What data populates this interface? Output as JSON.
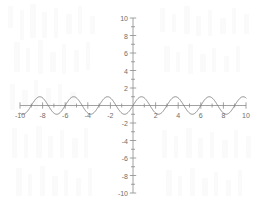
{
  "chart_data": {
    "type": "line",
    "title": "",
    "subtitle": "",
    "xlabel": "",
    "ylabel": "",
    "xlim": [
      -10,
      10
    ],
    "ylim": [
      -10,
      10
    ],
    "grid": false,
    "legend": null,
    "axis_style": "cartesian-crosshair",
    "x_tick_labels": [
      "-10",
      "-8",
      "-6",
      "-4",
      "-2",
      "2",
      "4",
      "6",
      "8",
      "10"
    ],
    "x_tick_values": [
      -10,
      -8,
      -6,
      -4,
      -2,
      2,
      4,
      6,
      8,
      10
    ],
    "x_minor_tick_step": 1,
    "y_tick_labels": [
      "10",
      "8",
      "6",
      "4",
      "2",
      "-2",
      "-4",
      "-6",
      "-8",
      "-10"
    ],
    "y_tick_values": [
      10,
      8,
      6,
      4,
      2,
      -2,
      -4,
      -6,
      -8,
      -10
    ],
    "y_minor_tick_step": 1,
    "series": [
      {
        "name": "cosine wave",
        "color": "#7a7a7a",
        "amplitude": 1,
        "period": 3,
        "phase_peak_x": 0.75,
        "x": [
          -10,
          -9.75,
          -9.5,
          -9.25,
          -9,
          -8.75,
          -8.5,
          -8.25,
          -8,
          -7.75,
          -7.5,
          -7.25,
          -7,
          -6.75,
          -6.5,
          -6.25,
          -6,
          -5.75,
          -5.5,
          -5.25,
          -5,
          -4.75,
          -4.5,
          -4.25,
          -4,
          -3.75,
          -3.5,
          -3.25,
          -3,
          -2.75,
          -2.5,
          -2.25,
          -2,
          -1.75,
          -1.5,
          -1.25,
          -1,
          -0.75,
          -0.5,
          -0.25,
          0,
          0.25,
          0.5,
          0.75,
          1,
          1.25,
          1.5,
          1.75,
          2,
          2.25,
          2.5,
          2.75,
          3,
          3.25,
          3.5,
          3.75,
          4,
          4.25,
          4.5,
          4.75,
          5,
          5.25,
          5.5,
          5.75,
          6,
          6.25,
          6.5,
          6.75,
          7,
          7.25,
          7.5,
          7.75,
          8,
          8.25,
          8.5,
          8.75,
          9,
          9.25,
          9.5,
          9.75,
          10
        ],
        "y": [
          -0.5,
          -0.87,
          -1,
          -0.87,
          -0.5,
          0,
          0.5,
          0.87,
          1,
          0.87,
          0.5,
          0,
          -0.5,
          -0.87,
          -1,
          -0.87,
          -0.5,
          0,
          0.5,
          0.87,
          1,
          0.87,
          0.5,
          0,
          -0.5,
          -0.87,
          -1,
          -0.87,
          -0.5,
          0,
          0.5,
          0.87,
          1,
          0.87,
          0.5,
          0,
          -0.5,
          -0.87,
          -1,
          -0.87,
          -0.5,
          0,
          0.5,
          0.87,
          1,
          0.87,
          0.5,
          0,
          -0.5,
          -0.87,
          -1,
          -0.87,
          -0.5,
          0,
          0.5,
          0.87,
          1,
          0.87,
          0.5,
          0,
          -0.5,
          -0.87,
          -1,
          -0.87,
          -0.5,
          0,
          0.5,
          0.87,
          1,
          0.87,
          0.5,
          0,
          -0.5,
          -0.87,
          -1,
          -0.87,
          -0.5,
          0,
          0.5,
          0.87,
          1
        ]
      }
    ],
    "colors": {
      "curve": "#7a7a7a",
      "axis": "#8a8a8a",
      "tick_text": "#6e6e6e",
      "background": "#ffffff",
      "watermark": "#fafafa"
    }
  }
}
